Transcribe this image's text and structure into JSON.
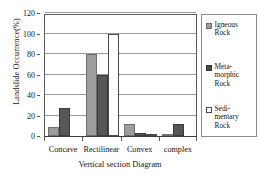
{
  "chart_data": {
    "type": "bar",
    "title": "",
    "xlabel": "Vertical section Diagram",
    "ylabel": "Landslide Occurrence(%)",
    "categories": [
      "Concave",
      "Rectilinear",
      "Convex",
      "complex"
    ],
    "series": [
      {
        "name": "Igneous Rock",
        "color": "#9d9d9d",
        "values": [
          9,
          80,
          12,
          2
        ]
      },
      {
        "name": "Meta-morphic Rock",
        "color": "#575757",
        "values": [
          27.5,
          60,
          3,
          11.5
        ]
      },
      {
        "name": "Sedi-mentary Rock",
        "color": "#ffffff",
        "values": [
          0,
          100,
          1.5,
          0
        ]
      }
    ],
    "ylim": [
      0,
      120
    ],
    "yticks": [
      0,
      20,
      40,
      60,
      80,
      100,
      120
    ],
    "ytick_labels": [
      "0",
      "20",
      "40",
      "60",
      "80",
      "100",
      "120"
    ],
    "grid": true,
    "legend_position": "right"
  },
  "legend": {
    "items": [
      {
        "label_line1": "Igneous",
        "label_line2": "Rock",
        "label_line3": ""
      },
      {
        "label_line1": "Meta-",
        "label_line2": "morphic",
        "label_line3": "Rock"
      },
      {
        "label_line1": "Sedi-",
        "label_line2": "mentary",
        "label_line3": "Rock"
      }
    ]
  }
}
